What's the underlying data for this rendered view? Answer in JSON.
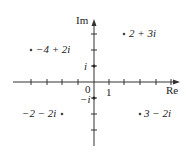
{
  "axes": {
    "x_label": "Re",
    "y_label": "Im",
    "origin_label": "0",
    "x_unit_label": "1",
    "y_unit_label": "i",
    "y_neg_unit_label": "−i"
  },
  "points": [
    {
      "label": "2 + 3i",
      "re": 2,
      "im": 3
    },
    {
      "label": "−4 + 2i",
      "re": -4,
      "im": 2
    },
    {
      "label": "−2 − 2i",
      "re": -2,
      "im": -2
    },
    {
      "label": "3 − 2i",
      "re": 3,
      "im": -2
    }
  ],
  "colors": {
    "ink": "#222222",
    "background": "#ffffff"
  }
}
